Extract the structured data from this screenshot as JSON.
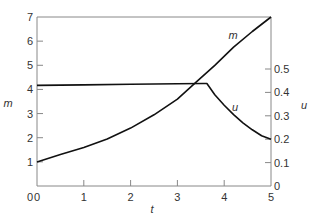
{
  "chart_data": {
    "type": "line",
    "title": "",
    "xlabel": "t",
    "ylabel_left": "m",
    "ylabel_right": "u",
    "xlim": [
      0,
      5
    ],
    "ylim_left": [
      0,
      7
    ],
    "ylim_right": [
      0,
      0.6
    ],
    "x_ticks": [
      "0",
      "1",
      "2",
      "3",
      "4",
      "5"
    ],
    "y_left_ticks": [
      "1",
      "2",
      "3",
      "4",
      "5",
      "6",
      "7"
    ],
    "y_right_ticks": [
      "0",
      "0.1",
      "0.2",
      "0.3",
      "0.4",
      "0.5"
    ],
    "grid": false,
    "legend": "inline labels",
    "series": [
      {
        "name": "m",
        "axis": "left",
        "x": [
          0,
          0.5,
          1,
          1.5,
          2,
          2.5,
          3,
          3.4,
          3.8,
          4.2,
          4.6,
          5
        ],
        "values": [
          1.0,
          1.3,
          1.6,
          1.95,
          2.4,
          2.95,
          3.6,
          4.3,
          5.0,
          5.75,
          6.4,
          7.0
        ]
      },
      {
        "name": "u",
        "axis": "right",
        "x": [
          0,
          1,
          2,
          3,
          3.55,
          3.63,
          3.8,
          4.0,
          4.2,
          4.4,
          4.6,
          4.8,
          5
        ],
        "values": [
          0.43,
          0.432,
          0.435,
          0.437,
          0.438,
          0.438,
          0.39,
          0.345,
          0.305,
          0.27,
          0.24,
          0.215,
          0.2
        ]
      }
    ],
    "annotations": [
      {
        "text": "m",
        "x": 3.95,
        "y_left": 6.3
      },
      {
        "text": "u",
        "x": 3.85,
        "y_right": 0.3
      }
    ]
  },
  "labels": {
    "xlabel": "t",
    "ylabel_left": "m",
    "ylabel_right": "u",
    "curve_m": "m",
    "curve_u": "u"
  }
}
